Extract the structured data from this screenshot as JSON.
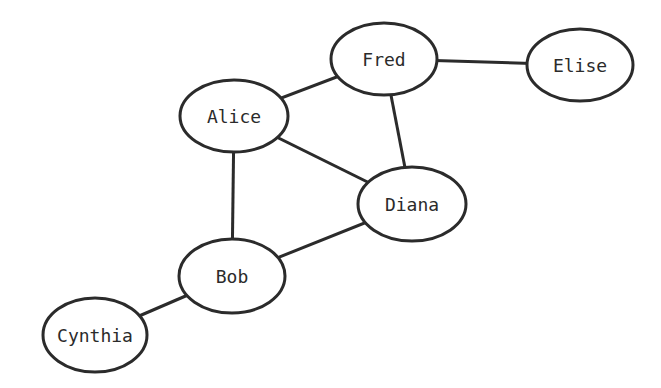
{
  "graph": {
    "nodes": [
      {
        "id": "alice",
        "label": "Alice",
        "cx": 234,
        "cy": 116,
        "rx": 54,
        "ry": 36
      },
      {
        "id": "fred",
        "label": "Fred",
        "cx": 384,
        "cy": 59,
        "rx": 53,
        "ry": 36
      },
      {
        "id": "elise",
        "label": "Elise",
        "cx": 580,
        "cy": 65,
        "rx": 53,
        "ry": 36
      },
      {
        "id": "diana",
        "label": "Diana",
        "cx": 412,
        "cy": 204,
        "rx": 54,
        "ry": 37
      },
      {
        "id": "bob",
        "label": "Bob",
        "cx": 232,
        "cy": 276,
        "rx": 53,
        "ry": 37
      },
      {
        "id": "cynthia",
        "label": "Cynthia",
        "cx": 95,
        "cy": 335,
        "rx": 52,
        "ry": 37
      }
    ],
    "edges": [
      {
        "from": "alice",
        "to": "fred"
      },
      {
        "from": "fred",
        "to": "elise"
      },
      {
        "from": "fred",
        "to": "diana"
      },
      {
        "from": "alice",
        "to": "diana"
      },
      {
        "from": "alice",
        "to": "bob"
      },
      {
        "from": "bob",
        "to": "diana"
      },
      {
        "from": "bob",
        "to": "cynthia"
      }
    ]
  }
}
